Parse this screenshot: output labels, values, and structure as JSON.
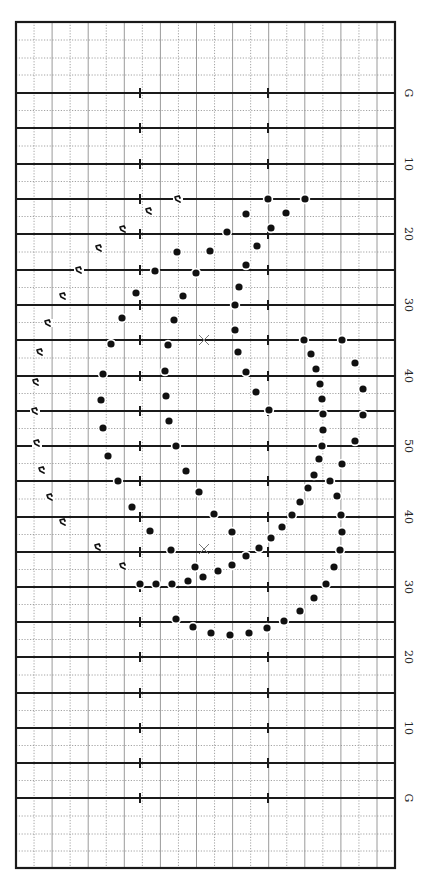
{
  "chart_data": {
    "type": "scatter",
    "title": "",
    "field": {
      "frame": {
        "x": 16,
        "y": 22,
        "width": 379,
        "height": 846
      },
      "column_spacing": 18.05,
      "column_count": 21,
      "yard_lines": [
        {
          "y": 93,
          "label": "G"
        },
        {
          "y": 128,
          "label": ""
        },
        {
          "y": 164,
          "label": "10"
        },
        {
          "y": 199,
          "label": ""
        },
        {
          "y": 234,
          "label": "20"
        },
        {
          "y": 270,
          "label": ""
        },
        {
          "y": 305,
          "label": "30"
        },
        {
          "y": 340,
          "label": ""
        },
        {
          "y": 376,
          "label": "40"
        },
        {
          "y": 411,
          "label": ""
        },
        {
          "y": 446,
          "label": "50"
        },
        {
          "y": 481,
          "label": ""
        },
        {
          "y": 517,
          "label": "40"
        },
        {
          "y": 552,
          "label": ""
        },
        {
          "y": 587,
          "label": "30"
        },
        {
          "y": 622,
          "label": ""
        },
        {
          "y": 657,
          "label": "20"
        },
        {
          "y": 693,
          "label": ""
        },
        {
          "y": 728,
          "label": "10"
        },
        {
          "y": 763,
          "label": ""
        },
        {
          "y": 798,
          "label": "G"
        }
      ],
      "half_yard_dotted_offsets": [
        17.6
      ],
      "end_zone_dotted_lines": [
        40,
        58,
        75,
        816,
        834,
        851
      ],
      "hash_marks_x": [
        140,
        268
      ],
      "label_x": 405
    },
    "markers": {
      "center_x": [
        {
          "x": 204,
          "y": 340
        },
        {
          "x": 204,
          "y": 549
        }
      ]
    },
    "performers": [
      {
        "x": 268,
        "y": 199
      },
      {
        "x": 305,
        "y": 199
      },
      {
        "x": 246,
        "y": 214
      },
      {
        "x": 286,
        "y": 213
      },
      {
        "x": 227,
        "y": 232
      },
      {
        "x": 271,
        "y": 228
      },
      {
        "x": 257,
        "y": 246
      },
      {
        "x": 177,
        "y": 252
      },
      {
        "x": 210,
        "y": 251
      },
      {
        "x": 246,
        "y": 265
      },
      {
        "x": 155,
        "y": 271
      },
      {
        "x": 196,
        "y": 273
      },
      {
        "x": 239,
        "y": 287
      },
      {
        "x": 136,
        "y": 293
      },
      {
        "x": 183,
        "y": 296
      },
      {
        "x": 235,
        "y": 305
      },
      {
        "x": 122,
        "y": 318
      },
      {
        "x": 174,
        "y": 320
      },
      {
        "x": 235,
        "y": 330
      },
      {
        "x": 111,
        "y": 344
      },
      {
        "x": 168,
        "y": 345
      },
      {
        "x": 304,
        "y": 340
      },
      {
        "x": 342,
        "y": 340
      },
      {
        "x": 238,
        "y": 352
      },
      {
        "x": 311,
        "y": 354
      },
      {
        "x": 355,
        "y": 363
      },
      {
        "x": 103,
        "y": 374
      },
      {
        "x": 165,
        "y": 371
      },
      {
        "x": 246,
        "y": 372
      },
      {
        "x": 316,
        "y": 369
      },
      {
        "x": 320,
        "y": 384
      },
      {
        "x": 363,
        "y": 389
      },
      {
        "x": 256,
        "y": 392
      },
      {
        "x": 322,
        "y": 399
      },
      {
        "x": 101,
        "y": 400
      },
      {
        "x": 166,
        "y": 396
      },
      {
        "x": 269,
        "y": 410
      },
      {
        "x": 323,
        "y": 414
      },
      {
        "x": 363,
        "y": 415
      },
      {
        "x": 103,
        "y": 428
      },
      {
        "x": 169,
        "y": 421
      },
      {
        "x": 323,
        "y": 430
      },
      {
        "x": 355,
        "y": 441
      },
      {
        "x": 322,
        "y": 446
      },
      {
        "x": 176,
        "y": 446
      },
      {
        "x": 108,
        "y": 456
      },
      {
        "x": 319,
        "y": 459
      },
      {
        "x": 342,
        "y": 464
      },
      {
        "x": 186,
        "y": 471
      },
      {
        "x": 314,
        "y": 475
      },
      {
        "x": 118,
        "y": 481
      },
      {
        "x": 330,
        "y": 481
      },
      {
        "x": 308,
        "y": 488
      },
      {
        "x": 199,
        "y": 492
      },
      {
        "x": 337,
        "y": 496
      },
      {
        "x": 300,
        "y": 502
      },
      {
        "x": 132,
        "y": 507
      },
      {
        "x": 214,
        "y": 514
      },
      {
        "x": 292,
        "y": 515
      },
      {
        "x": 341,
        "y": 515
      },
      {
        "x": 282,
        "y": 527
      },
      {
        "x": 150,
        "y": 531
      },
      {
        "x": 232,
        "y": 532
      },
      {
        "x": 342,
        "y": 532
      },
      {
        "x": 271,
        "y": 538
      },
      {
        "x": 259,
        "y": 548
      },
      {
        "x": 171,
        "y": 550
      },
      {
        "x": 340,
        "y": 550
      },
      {
        "x": 246,
        "y": 556
      },
      {
        "x": 195,
        "y": 567
      },
      {
        "x": 232,
        "y": 565
      },
      {
        "x": 334,
        "y": 567
      },
      {
        "x": 218,
        "y": 571
      },
      {
        "x": 203,
        "y": 577
      },
      {
        "x": 140,
        "y": 584
      },
      {
        "x": 156,
        "y": 584
      },
      {
        "x": 172,
        "y": 584
      },
      {
        "x": 188,
        "y": 581
      },
      {
        "x": 326,
        "y": 584
      },
      {
        "x": 314,
        "y": 598
      },
      {
        "x": 300,
        "y": 611
      },
      {
        "x": 176,
        "y": 619
      },
      {
        "x": 284,
        "y": 621
      },
      {
        "x": 193,
        "y": 627
      },
      {
        "x": 267,
        "y": 628
      },
      {
        "x": 211,
        "y": 633
      },
      {
        "x": 249,
        "y": 633
      },
      {
        "x": 230,
        "y": 635
      }
    ],
    "flags": [
      {
        "x": 177,
        "y": 199
      },
      {
        "x": 148,
        "y": 211
      },
      {
        "x": 122,
        "y": 229
      },
      {
        "x": 98,
        "y": 248
      },
      {
        "x": 78,
        "y": 270
      },
      {
        "x": 62,
        "y": 296
      },
      {
        "x": 47,
        "y": 323
      },
      {
        "x": 39,
        "y": 352
      },
      {
        "x": 35,
        "y": 382
      },
      {
        "x": 34,
        "y": 411
      },
      {
        "x": 36,
        "y": 443
      },
      {
        "x": 41,
        "y": 470
      },
      {
        "x": 49,
        "y": 497
      },
      {
        "x": 62,
        "y": 522
      },
      {
        "x": 97,
        "y": 547
      },
      {
        "x": 122,
        "y": 566
      }
    ]
  },
  "colors": {
    "frame": "#1a1a1a",
    "yard_line": "#1a1a1a",
    "grid_solid": "#9a9a9a",
    "grid_dotted": "#8c8c8c",
    "dot": "#111111",
    "marker_x": "#777777",
    "background": "#ffffff"
  }
}
